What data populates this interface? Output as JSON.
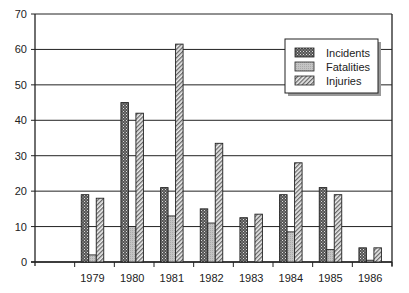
{
  "chart_data": {
    "type": "bar",
    "title": "",
    "xlabel": "",
    "ylabel": "",
    "ylim": [
      0,
      70
    ],
    "yticks": [
      0,
      10,
      20,
      30,
      40,
      50,
      60,
      70
    ],
    "grid": true,
    "legend_position": "upper right (inside)",
    "categories": [
      "1979",
      "1980",
      "1981",
      "1982",
      "1983",
      "1984",
      "1985",
      "1986"
    ],
    "series": [
      {
        "name": "Incidents",
        "pattern": "dark-crosshatch",
        "values": [
          19,
          45,
          21,
          15,
          12.5,
          19,
          21,
          4
        ]
      },
      {
        "name": "Fatalities",
        "pattern": "light-gray",
        "values": [
          2,
          10,
          13,
          11,
          0,
          8.5,
          3.5,
          0.5
        ]
      },
      {
        "name": "Injuries",
        "pattern": "diagonal-hatch",
        "values": [
          18,
          42,
          61.5,
          33.5,
          13.5,
          28,
          19,
          4
        ]
      }
    ]
  },
  "legend": {
    "items": [
      "Incidents",
      "Fatalities",
      "Injuries"
    ]
  }
}
